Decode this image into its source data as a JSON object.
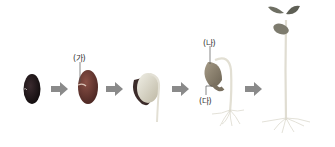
{
  "diagram": {
    "stages": [
      {
        "name": "dry-seed"
      },
      {
        "name": "swollen-seed"
      },
      {
        "name": "radicle-emerging"
      },
      {
        "name": "seedling-with-cotyledons"
      },
      {
        "name": "young-plant"
      }
    ],
    "labels": {
      "ga": "(가)",
      "na": "(나)",
      "da": "(다)"
    },
    "colors": {
      "seed_dark": "#1a1416",
      "seed_red": "#6b3b35",
      "arrow": "#8a8a8a",
      "stem": "#dedbcf",
      "leaf": "#6e6f63"
    }
  }
}
